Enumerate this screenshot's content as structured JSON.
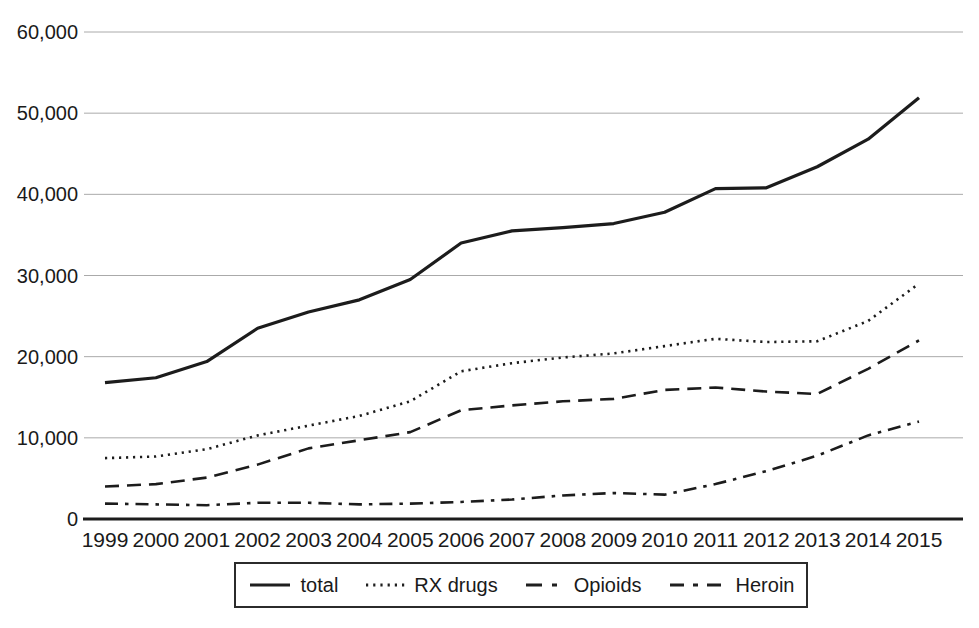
{
  "figure": {
    "background": "#ffffff"
  },
  "chart_data": {
    "type": "line",
    "title": "",
    "xlabel": "",
    "ylabel": "",
    "x": [
      1999,
      2000,
      2001,
      2002,
      2003,
      2004,
      2005,
      2006,
      2007,
      2008,
      2009,
      2010,
      2011,
      2012,
      2013,
      2014,
      2015
    ],
    "xtick_labels": [
      "1999",
      "2000",
      "2001",
      "2002",
      "2003",
      "2004",
      "2005",
      "2006",
      "2007",
      "2008",
      "2009",
      "2010",
      "2011",
      "2012",
      "2013",
      "2014",
      "2015"
    ],
    "series": [
      {
        "name": "total",
        "style": "solid",
        "values": [
          16800,
          17400,
          19400,
          23500,
          25500,
          27000,
          29500,
          34000,
          35500,
          35900,
          36400,
          37800,
          40700,
          40800,
          43400,
          46800,
          51900
        ]
      },
      {
        "name": "RX drugs",
        "style": "dotted",
        "values": [
          7500,
          7700,
          8600,
          10300,
          11500,
          12700,
          14500,
          18200,
          19200,
          19900,
          20400,
          21300,
          22200,
          21800,
          21900,
          24400,
          29000
        ]
      },
      {
        "name": "Opioids",
        "style": "dashed",
        "values": [
          4000,
          4300,
          5100,
          6700,
          8700,
          9700,
          10700,
          13400,
          14000,
          14500,
          14800,
          15900,
          16200,
          15700,
          15400,
          18500,
          22000
        ]
      },
      {
        "name": "Heroin",
        "style": "dash-dot",
        "values": [
          1900,
          1800,
          1700,
          2000,
          2000,
          1800,
          1900,
          2100,
          2400,
          2900,
          3200,
          3000,
          4300,
          5900,
          7800,
          10300,
          12000
        ]
      }
    ],
    "ylim": [
      0,
      60000
    ],
    "ytick_interval": 10000,
    "ytick_labels": [
      "0",
      "10,000",
      "20,000",
      "30,000",
      "40,000",
      "50,000",
      "60,000"
    ],
    "grid": true,
    "legend_position": "bottom",
    "colors": {
      "line": "#1c1c1c",
      "grid": "#aaaaaa",
      "text": "#1a1a1a"
    }
  }
}
